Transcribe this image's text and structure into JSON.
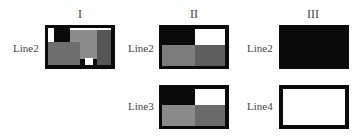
{
  "columns": [
    {
      "header": "I"
    },
    {
      "header": "II"
    },
    {
      "header": "III"
    }
  ],
  "rows": {
    "col1": [
      {
        "label": "Line2"
      }
    ],
    "col2": [
      {
        "label": "Line2"
      },
      {
        "label": "Line3"
      }
    ],
    "col3": [
      {
        "label": "Line2"
      },
      {
        "label": "Line4"
      }
    ]
  },
  "colors": {
    "black": "#0a0a0a",
    "white": "#ffffff",
    "light_gray": "#8c8c8c",
    "mid_gray": "#6e6e6e",
    "dark_gray": "#555555"
  }
}
